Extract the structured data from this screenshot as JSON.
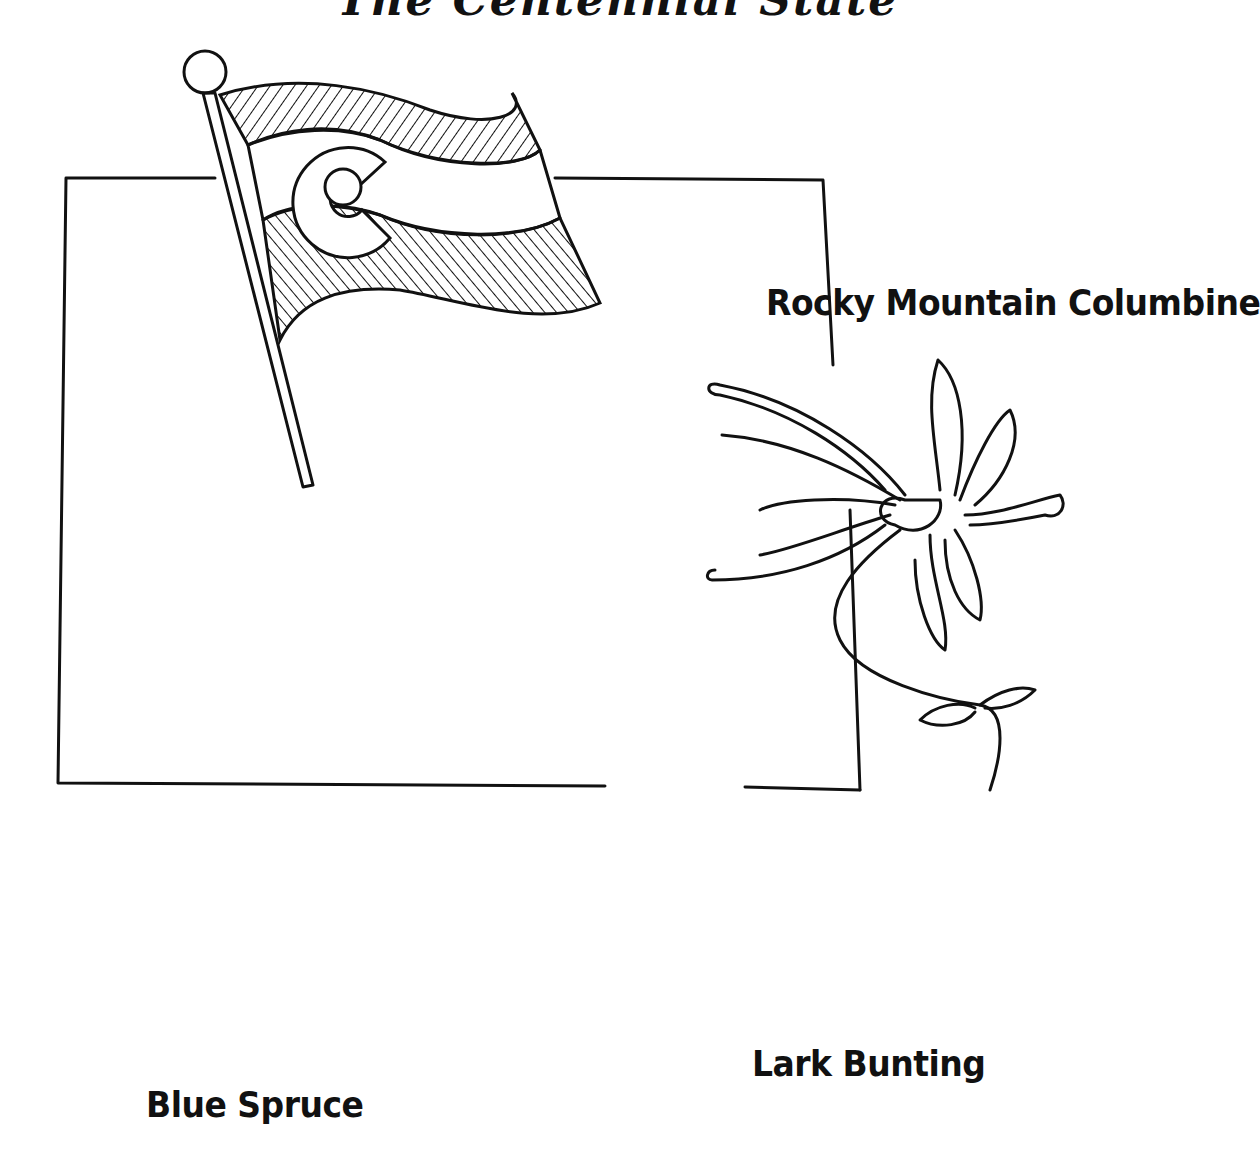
{
  "page": {
    "title": "The Centennial State"
  },
  "illustration": {
    "state_outline": "Colorado",
    "items": [
      {
        "id": "flag",
        "label": "",
        "description": "Colorado state flag on pole"
      },
      {
        "id": "flower",
        "label": "Rocky Mountain Columbine"
      },
      {
        "id": "tree",
        "label": "Blue Spruce"
      },
      {
        "id": "bird",
        "label": "Lark Bunting"
      }
    ]
  },
  "colors": {
    "ink": "#111111",
    "paper": "#ffffff"
  }
}
